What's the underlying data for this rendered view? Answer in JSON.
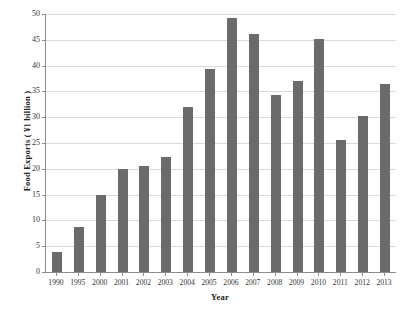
{
  "chart_data": {
    "type": "bar",
    "title": "",
    "xlabel": "Year",
    "ylabel": "Food Exports ( ¥1 billion )",
    "categories": [
      "1990",
      "1995",
      "2000",
      "2001",
      "2002",
      "2003",
      "2004",
      "2005",
      "2006",
      "2007",
      "2008",
      "2009",
      "2010",
      "2011",
      "2012",
      "2013"
    ],
    "values": [
      3.9,
      8.8,
      15.0,
      19.9,
      20.5,
      22.2,
      31.9,
      39.4,
      49.3,
      46.2,
      34.3,
      37.0,
      45.1,
      25.5,
      30.2,
      36.5
    ],
    "ylim": [
      0,
      50
    ],
    "yticks": [
      0,
      5,
      10,
      15,
      20,
      25,
      30,
      35,
      40,
      45,
      50
    ],
    "ytick_labels": [
      "0",
      "5",
      "10",
      "15",
      "20",
      "25",
      "30",
      "35",
      "40",
      "45",
      "50"
    ],
    "grid": true,
    "legend": false,
    "bar_color": "#6b6b6b",
    "axis_color": "#8c8c8c",
    "grid_color": "#d9d9d9",
    "background": "#ffffff"
  }
}
